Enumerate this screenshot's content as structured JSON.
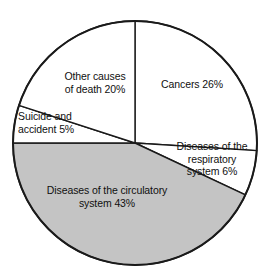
{
  "chart_data": {
    "type": "pie",
    "title": "",
    "subtitle": "",
    "xlabel": "",
    "ylabel": "",
    "legend_position": "none",
    "grid": false,
    "units": "percent",
    "start_angle_deg": 0,
    "direction": "clockwise",
    "categories": [
      "Cancers",
      "Diseases of the respiratory system",
      "Diseases of the circulatory system",
      "Suicide and accident",
      "Other causes of death"
    ],
    "values": [
      26,
      6,
      43,
      5,
      20
    ],
    "slices": [
      {
        "name": "cancers",
        "label": "Cancers 26%",
        "value": 26,
        "color": "#ffffff",
        "start_deg": 0,
        "end_deg": 93.6
      },
      {
        "name": "respiratory",
        "label": "Diseases of the\nrespiratory\nsystem 6%",
        "value": 6,
        "color": "#ffffff",
        "start_deg": 93.6,
        "end_deg": 115.2
      },
      {
        "name": "circulatory",
        "label": "Diseases of the circulatory\nsystem 43%",
        "value": 43,
        "color": "#c4c4c4",
        "start_deg": 115.2,
        "end_deg": 270.0
      },
      {
        "name": "suicide-accident",
        "label": "Suicide and\naccident 5%",
        "value": 5,
        "color": "#ffffff",
        "start_deg": 270.0,
        "end_deg": 288.0
      },
      {
        "name": "other-causes",
        "label": "Other causes\nof death 20%",
        "value": 20,
        "color": "#ffffff",
        "start_deg": 288.0,
        "end_deg": 360.0
      }
    ],
    "geometry": {
      "center_x": 135,
      "center_y": 143,
      "radius": 122
    },
    "colors": {
      "highlight_fill": "#c4c4c4",
      "plain_fill": "#ffffff",
      "stroke": "#1a1a1a",
      "text": "#101010",
      "background": "#ffffff"
    }
  }
}
